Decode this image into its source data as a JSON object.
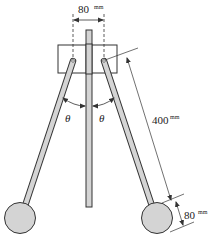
{
  "diagram": {
    "type": "mechanism",
    "colors": {
      "stroke": "#333333",
      "fill_gray": "#d4d4d4",
      "background": "#ffffff"
    },
    "dimensions": {
      "pivot_spacing": {
        "value": "80",
        "unit": "mm"
      },
      "arm_length": {
        "value": "400",
        "unit": "mm"
      },
      "bob_diameter": {
        "value": "80",
        "unit": "mm"
      }
    },
    "angles": {
      "left": "θ",
      "right": "θ"
    }
  }
}
